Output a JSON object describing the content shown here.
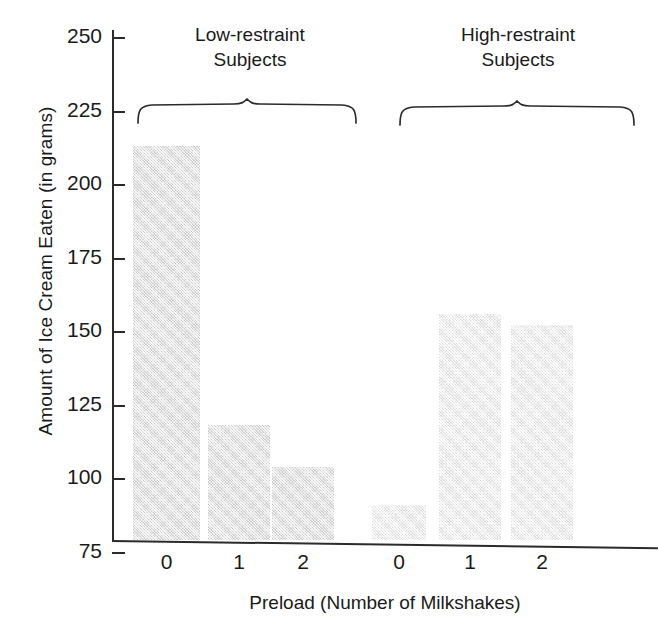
{
  "chart_data": {
    "type": "bar",
    "title": "",
    "xlabel": "Preload (Number of Milkshakes)",
    "ylabel": "Amount of Ice Cream Eaten (in grams)",
    "ylim": [
      62,
      258
    ],
    "yticks": [
      75,
      100,
      125,
      150,
      175,
      200,
      225,
      250
    ],
    "ytick_labels": [
      "75",
      "100",
      "125",
      "150",
      "175",
      "200",
      "225",
      "250"
    ],
    "grid": false,
    "legend": "none",
    "categories": [
      "0",
      "1",
      "2",
      "0",
      "1",
      "2"
    ],
    "groups": [
      {
        "name": "Low-restraint Subjects",
        "categories": [
          "0",
          "1",
          "2"
        ],
        "values": [
          213,
          118,
          104
        ]
      },
      {
        "name": "High-restraint Subjects",
        "categories": [
          "0",
          "1",
          "2"
        ],
        "values": [
          91,
          156,
          152
        ]
      }
    ],
    "values": [
      213,
      118,
      104,
      91,
      156,
      152
    ],
    "bar_fill_low": "#e3e3e3",
    "bar_fill_high": "#eeeeee",
    "axis_color": "#2b2b2b"
  },
  "bars": [
    {
      "label": "0",
      "value": 213,
      "group": "low",
      "left": 133,
      "width": 67
    },
    {
      "label": "1",
      "value": 118,
      "group": "low",
      "left": 208,
      "width": 62
    },
    {
      "label": "2",
      "value": 104,
      "group": "low",
      "left": 272,
      "width": 62
    },
    {
      "label": "0",
      "value": 91,
      "group": "high",
      "left": 372,
      "width": 54
    },
    {
      "label": "1",
      "value": 156,
      "group": "high",
      "left": 439,
      "width": 62
    },
    {
      "label": "2",
      "value": 152,
      "group": "high",
      "left": 511,
      "width": 62
    }
  ],
  "group_headers": [
    {
      "line1": "Low-restraint",
      "line2": "Subjects"
    },
    {
      "line1": "High-restraint",
      "line2": "Subjects"
    }
  ]
}
